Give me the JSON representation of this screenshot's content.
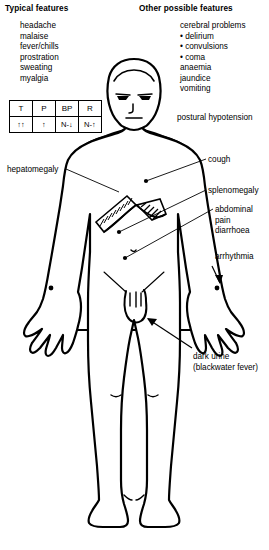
{
  "headers": {
    "left": "Typical features",
    "right": "Other possible features"
  },
  "typical_features": [
    "headache",
    "malaise",
    "fever/chills",
    "prostration",
    "sweating",
    "myalgia"
  ],
  "other_possible_features": [
    "cerebral problems",
    "• delirium",
    "• convulsions",
    "• coma",
    "anaemia",
    "jaundice",
    "vomiting"
  ],
  "vitals_table": {
    "headers": [
      "T",
      "P",
      "BP",
      "R"
    ],
    "values": [
      "↑↑",
      "↑",
      "N-↓",
      "N-↑"
    ]
  },
  "annotations": {
    "postural_hypotension": "postural hypotension",
    "hepatomegaly": "hepatomegaly",
    "cough": "cough",
    "splenomegaly": "splenomegaly",
    "abdominal": [
      "abdominal",
      "pain",
      "diarrhoea"
    ],
    "arrhythmia": "arrhythmia",
    "dark_urine": [
      "dark urine",
      "(blackwater fever)"
    ]
  },
  "figure": {
    "name": "human-body-front-view",
    "stroke_color": "#000000",
    "fill_color": "#ffffff"
  }
}
